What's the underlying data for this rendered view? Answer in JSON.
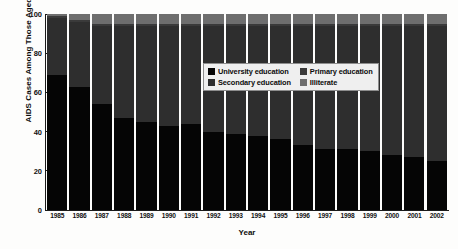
{
  "chart_data": {
    "type": "bar",
    "variant": "stacked-100-percent",
    "title": "",
    "xlabel": "Year",
    "ylabel": "AIDS Cases Among Those Aged 19 Years and Older, %",
    "ylim": [
      0,
      100
    ],
    "yticks": [
      0,
      20,
      40,
      60,
      80,
      100
    ],
    "grid": false,
    "legend_position": "inside-upper-center",
    "categories": [
      "1985",
      "1986",
      "1987",
      "1988",
      "1989",
      "1990",
      "1991",
      "1992",
      "1993",
      "1994",
      "1995",
      "1996",
      "1997",
      "1998",
      "1999",
      "2000",
      "2001",
      "2002"
    ],
    "series": [
      {
        "name": "University education",
        "color": "#050505",
        "values": [
          69,
          63,
          54,
          47,
          45,
          43,
          44,
          40,
          39,
          38,
          36,
          33,
          31,
          31,
          30,
          28,
          27,
          25
        ]
      },
      {
        "name": "Secondary education",
        "color": "#2e2e2e",
        "values": [
          29,
          33,
          40,
          47,
          49,
          51,
          50,
          54,
          55,
          56,
          58,
          61,
          63,
          63,
          64,
          66,
          67,
          69
        ]
      },
      {
        "name": "Primary education",
        "color": "#3a3a3a",
        "values": [
          1,
          1,
          1,
          1,
          1,
          1,
          1,
          1,
          1,
          1,
          1,
          1,
          1,
          1,
          1,
          1,
          1,
          1
        ]
      },
      {
        "name": "Illiterate",
        "color": "#6e6e6e",
        "values": [
          1,
          3,
          5,
          5,
          5,
          5,
          5,
          5,
          5,
          5,
          5,
          5,
          5,
          5,
          5,
          5,
          5,
          5
        ]
      }
    ]
  },
  "legend": {
    "items": [
      {
        "label": "University education",
        "color": "#050505"
      },
      {
        "label": "Primary education",
        "color": "#3a3a3a"
      },
      {
        "label": "Secondary education",
        "color": "#2e2e2e"
      },
      {
        "label": "Illiterate",
        "color": "#6e6e6e"
      }
    ]
  }
}
